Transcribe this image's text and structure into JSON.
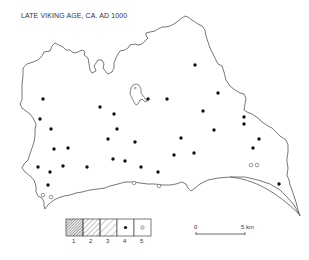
{
  "title": "LATE VIKING AGE, CA. AD 1000",
  "colors": {
    "outline": "#555555",
    "dot_filled": "#111111",
    "dot_open_stroke": "#555555",
    "background": "#ffffff"
  },
  "legend": {
    "items": [
      {
        "label": "1",
        "symbol": "dense-hatch"
      },
      {
        "label": "2",
        "symbol": "medium-hatch"
      },
      {
        "label": "3",
        "symbol": "sparse-hatch"
      },
      {
        "label": "4",
        "symbol": "filled-dot"
      },
      {
        "label": "5",
        "symbol": "open-dot"
      }
    ]
  },
  "scale_bar": {
    "start_label": "0",
    "end_label": "5 km"
  },
  "sites": {
    "filled": [
      [
        43,
        99
      ],
      [
        148,
        99
      ],
      [
        167,
        99
      ],
      [
        195,
        65
      ],
      [
        100,
        107
      ],
      [
        114,
        114
      ],
      [
        218,
        93
      ],
      [
        203,
        111
      ],
      [
        40,
        119
      ],
      [
        51,
        129
      ],
      [
        117,
        129
      ],
      [
        54,
        149
      ],
      [
        68,
        148
      ],
      [
        108,
        139
      ],
      [
        135,
        142
      ],
      [
        181,
        138
      ],
      [
        214,
        130
      ],
      [
        244,
        117
      ],
      [
        244,
        124
      ],
      [
        259,
        139
      ],
      [
        253,
        148
      ],
      [
        113,
        159
      ],
      [
        125,
        161
      ],
      [
        174,
        155
      ],
      [
        194,
        153
      ],
      [
        38,
        167
      ],
      [
        63,
        166
      ],
      [
        87,
        167
      ],
      [
        141,
        167
      ],
      [
        158,
        172
      ],
      [
        50,
        172
      ],
      [
        48,
        185
      ],
      [
        279,
        184
      ]
    ],
    "open": [
      [
        251,
        165
      ],
      [
        257,
        165
      ],
      [
        43,
        195
      ],
      [
        51,
        197
      ],
      [
        134,
        183
      ],
      [
        159,
        186
      ]
    ]
  }
}
